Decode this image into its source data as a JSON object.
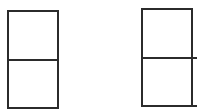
{
  "diagram": {
    "stroke_color": "#2b2b2b",
    "background": "#ffffff",
    "shapes": [
      {
        "name": "left-two-cell-box",
        "cells": 2,
        "bounds": {
          "x": 7,
          "y": 10,
          "w": 51,
          "h": 99
        },
        "divider_y": 59
      },
      {
        "name": "right-two-cell-box",
        "cells": 2,
        "bounds": {
          "x": 141,
          "y": 8,
          "w": 51,
          "h": 99
        },
        "divider_y": 57,
        "extended_lines_to_x": 197
      }
    ]
  }
}
